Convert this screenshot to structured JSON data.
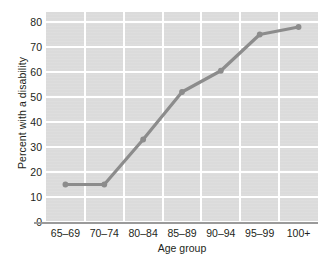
{
  "chart_data": {
    "type": "line",
    "title": "",
    "xlabel": "Age group",
    "ylabel": "Percent with a disability",
    "categories": [
      "65–69",
      "70–74",
      "80–84",
      "85–89",
      "90–94",
      "95–99",
      "100+"
    ],
    "values": [
      15,
      15,
      33,
      52,
      60.5,
      75,
      78
    ],
    "ylim": [
      0,
      84
    ],
    "yticks": [
      0,
      10,
      20,
      30,
      40,
      50,
      60,
      70,
      80
    ],
    "ytick_labels": [
      "0",
      "10",
      "20",
      "30",
      "40",
      "50",
      "60",
      "70",
      "80"
    ],
    "grid": true,
    "legend": "none",
    "series_color": "#8c8c8c",
    "marker_color": "#8c8c8c",
    "plot_background": "#dcdcdc",
    "gridline_color": "#ffffff",
    "axis_color": "#9a9a9a",
    "text_color": "#231f20"
  }
}
